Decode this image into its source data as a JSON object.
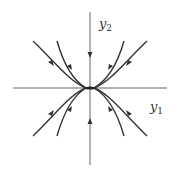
{
  "diagram": {
    "axes": {
      "horizontal_label": "y",
      "horizontal_subscript": "1",
      "vertical_label": "y",
      "vertical_subscript": "2"
    },
    "origin": [
      90,
      88
    ],
    "trajectories": [
      {
        "name": "upper-left-outer",
        "from": [
          33,
          41
        ]
      },
      {
        "name": "upper-left-inner",
        "from": [
          57,
          41
        ]
      },
      {
        "name": "upper-right-inner",
        "from": [
          124,
          41
        ]
      },
      {
        "name": "upper-right-outer",
        "from": [
          147,
          41
        ]
      },
      {
        "name": "lower-left-outer",
        "from": [
          33,
          136
        ]
      },
      {
        "name": "lower-left-inner",
        "from": [
          57,
          136
        ]
      },
      {
        "name": "lower-right-inner",
        "from": [
          124,
          136
        ]
      },
      {
        "name": "lower-right-outer",
        "from": [
          147,
          136
        ]
      }
    ],
    "colors": {
      "trajectory": "#333333",
      "axis": "#666666",
      "background": "#ffffff"
    }
  }
}
